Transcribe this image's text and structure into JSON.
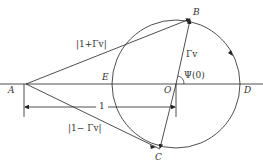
{
  "diagram": {
    "points": {
      "A": "A",
      "B": "B",
      "C": "C",
      "D": "D",
      "E": "E",
      "O": "O"
    },
    "labels": {
      "one_plus_gamma": "|1+Γv|",
      "one_minus_gamma": "|1− Γv|",
      "gamma": "Γv",
      "psi": "Ψ(0)",
      "unit": "1"
    },
    "colors": {
      "stroke": "#222222",
      "text": "#333333"
    }
  }
}
